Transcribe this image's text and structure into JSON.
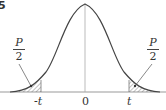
{
  "figure": {
    "figure_number_fragment": "5",
    "curve": "bell-shaped symmetric density curve",
    "center_label": "0",
    "left_cutoff_label": "-t",
    "right_cutoff_label": "t",
    "left_tail_label": {
      "numerator": "P",
      "denominator": "2"
    },
    "right_tail_label": {
      "numerator": "P",
      "denominator": "2"
    },
    "colors": {
      "line": "#444444",
      "hatch": "#666666",
      "axis": "#999999"
    }
  }
}
